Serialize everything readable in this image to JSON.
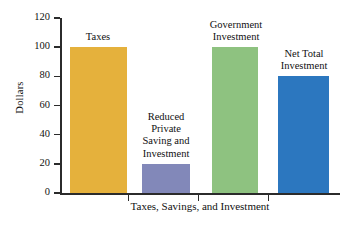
{
  "chart_data": {
    "type": "bar",
    "title": "",
    "xlabel": "Taxes, Savings, and Investment",
    "ylabel": "Dollars",
    "ylim": [
      0,
      120
    ],
    "yticks": [
      0,
      20,
      40,
      60,
      80,
      100,
      120
    ],
    "grid": false,
    "legend": "none",
    "categories": [
      "Taxes",
      "Reduced Private Saving and Investment",
      "Government Investment",
      "Net Total Investment"
    ],
    "values": [
      100,
      20,
      100,
      80
    ],
    "bars": [
      {
        "name": "Taxes",
        "label": "Taxes",
        "value": 100,
        "color": "#e5b13c",
        "label_lines": [
          "Taxes"
        ]
      },
      {
        "name": "Reduced Private Saving and Investment",
        "label": "Reduced\nPrivate\nSaving and\nInvestment",
        "value": 20,
        "color": "#8288b9",
        "label_lines": [
          "Reduced",
          "Private",
          "Saving and",
          "Investment"
        ]
      },
      {
        "name": "Government Investment",
        "label": "Government\nInvestment",
        "value": 100,
        "color": "#8ec280",
        "label_lines": [
          "Government",
          "Investment"
        ]
      },
      {
        "name": "Net Total Investment",
        "label": "Net Total\nInvestment",
        "value": 80,
        "color": "#2c77bf",
        "label_lines": [
          "Net Total",
          "Investment"
        ]
      }
    ]
  },
  "axis": {
    "y_title": "Dollars",
    "x_title": "Taxes, Savings, and Investment",
    "y_labels": [
      "120",
      "100",
      "80",
      "60",
      "40",
      "20",
      "0"
    ]
  },
  "colors": {
    "taxes": "#e5b13c",
    "reduced_private_saving": "#8288b9",
    "government_investment": "#8ec280",
    "net_total_investment": "#2c77bf",
    "axis": "#2b2b2b",
    "background": "#ffffff"
  }
}
